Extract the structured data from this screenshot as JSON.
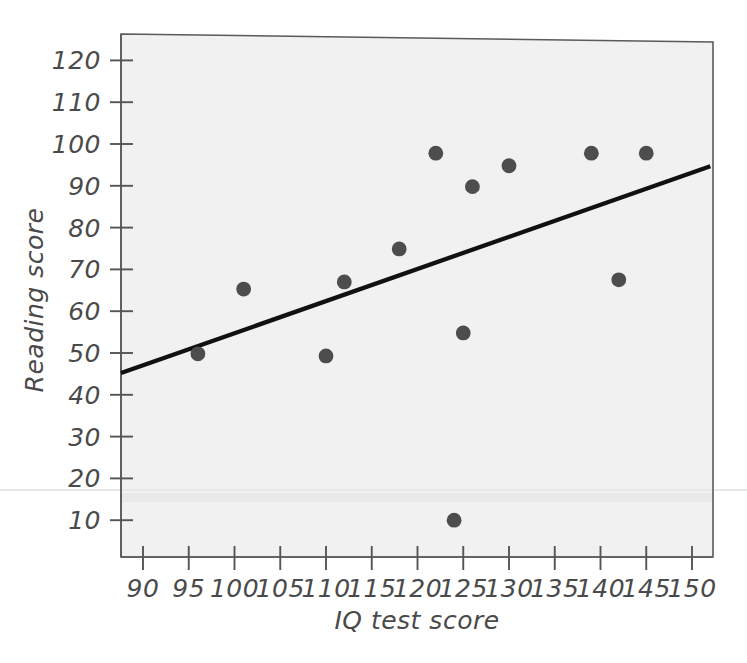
{
  "chart_data": {
    "type": "scatter",
    "title": "",
    "xlabel": "IQ test score",
    "ylabel": "Reading score",
    "xlim": [
      87.5,
      152
    ],
    "ylim": [
      5,
      124
    ],
    "xticks": [
      90,
      95,
      100,
      105,
      110,
      115,
      120,
      125,
      130,
      135,
      140,
      145,
      150
    ],
    "yticks": [
      10,
      20,
      30,
      40,
      50,
      60,
      70,
      80,
      90,
      100,
      110,
      120
    ],
    "grid": false,
    "legend": null,
    "series": [
      {
        "name": "observations",
        "marker": "filled-circle",
        "color": "#4d4d4d",
        "points": [
          {
            "x": 96,
            "y": 49.8
          },
          {
            "x": 101,
            "y": 65.3
          },
          {
            "x": 110,
            "y": 49.3
          },
          {
            "x": 112,
            "y": 67.0
          },
          {
            "x": 118,
            "y": 74.9
          },
          {
            "x": 122,
            "y": 97.8
          },
          {
            "x": 124,
            "y": 10.0
          },
          {
            "x": 125,
            "y": 54.8
          },
          {
            "x": 126,
            "y": 89.8
          },
          {
            "x": 130,
            "y": 94.8
          },
          {
            "x": 139,
            "y": 97.8
          },
          {
            "x": 142,
            "y": 67.5
          },
          {
            "x": 145,
            "y": 97.8
          }
        ]
      }
    ],
    "trendline": {
      "name": "regression-line",
      "color": "#111111",
      "x_start": 87.6,
      "y_start": 45.2,
      "x_end": 152.0,
      "y_end": 94.7
    },
    "colors": {
      "plot_background": "#f2f2f2",
      "axis": "#555555",
      "marker": "#4d4d4d",
      "trendline": "#111111",
      "text": "#4a4a4a"
    }
  },
  "axes": {
    "x_tick_labels": [
      "90",
      "95",
      "100",
      "105",
      "110",
      "115",
      "120",
      "125",
      "130",
      "135",
      "140",
      "145",
      "150"
    ],
    "y_tick_labels": [
      "10",
      "20",
      "30",
      "40",
      "50",
      "60",
      "70",
      "80",
      "90",
      "100",
      "110",
      "120"
    ],
    "x_axis_title": "IQ test score",
    "y_axis_title": "Reading score"
  }
}
